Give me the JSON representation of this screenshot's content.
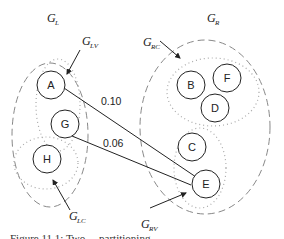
{
  "diagram": {
    "groups": {
      "left": {
        "label": "G",
        "sub": "L"
      },
      "right": {
        "label": "G",
        "sub": "R"
      }
    },
    "subgroups": {
      "lv": {
        "label": "G",
        "sub": "LV"
      },
      "lc": {
        "label": "G",
        "sub": "LC"
      },
      "rc": {
        "label": "G",
        "sub": "RC"
      },
      "rv": {
        "label": "G",
        "sub": "RV"
      }
    },
    "nodes": {
      "A": "A",
      "G": "G",
      "H": "H",
      "B": "B",
      "F": "F",
      "D": "D",
      "C": "C",
      "E": "E"
    },
    "edges": [
      {
        "from": "A",
        "to": "E",
        "weight": "0.10"
      },
      {
        "from": "G",
        "to": "E",
        "weight": "0.06"
      }
    ],
    "caption": "Figure 11.1: Two ... partitioning ..."
  }
}
